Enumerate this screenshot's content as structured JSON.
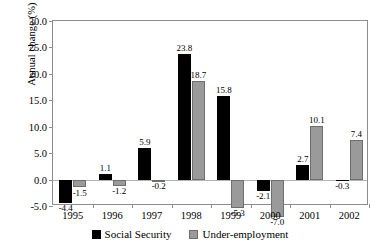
{
  "chart_data": {
    "type": "bar",
    "title": "",
    "xlabel": "",
    "ylabel": "Annual change (%)",
    "categories": [
      "1995",
      "1996",
      "1997",
      "1998",
      "1999",
      "2000",
      "2001",
      "2002"
    ],
    "series": [
      {
        "name": "Social Security",
        "color": "#000000",
        "values": [
          -4.4,
          1.1,
          5.9,
          23.8,
          15.8,
          -2.1,
          2.7,
          -0.3
        ],
        "labels": [
          "-4.4",
          "1.1",
          "5.9",
          "23.8",
          "15.8",
          "-2.1",
          "2.7",
          "-0.3"
        ]
      },
      {
        "name": "Under-employment",
        "color": "#9a9a9a",
        "values": [
          -1.5,
          -1.2,
          -0.2,
          18.7,
          -5.3,
          -7.0,
          10.1,
          7.4
        ],
        "labels": [
          "-1.5",
          "-1.2",
          "-0.2",
          "18.7",
          "-5.3",
          "-7.0",
          "10.1",
          "7.4"
        ]
      }
    ],
    "ylim": [
      -5.0,
      30.0
    ],
    "ytick_step": 5.0,
    "yticks": [
      -5.0,
      0.0,
      5.0,
      10.0,
      15.0,
      20.0,
      25.0,
      30.0
    ],
    "ytick_labels": [
      "-5.0",
      "0.0",
      "5.0",
      "10.0",
      "15.0",
      "20.0",
      "25.0",
      "30.0"
    ],
    "grid": false,
    "legend_position": "bottom-center",
    "zero_line": true
  }
}
